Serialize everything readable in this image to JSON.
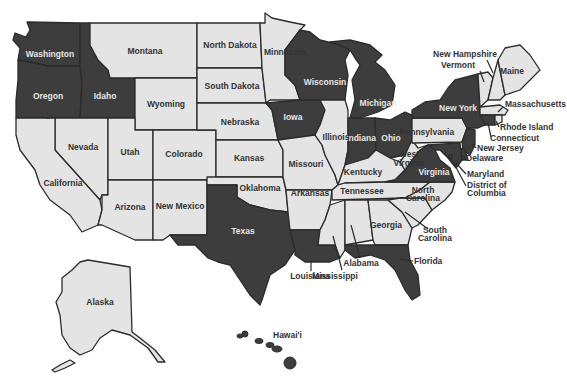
{
  "map": {
    "title": "",
    "colors": {
      "highlighted": "#3d3d3d",
      "normal": "#e4e4e4",
      "border": "#2b2b2b",
      "label_on_dark": "#e6e6e6",
      "label_on_light": "#333333",
      "background": "#ffffff"
    },
    "states": {
      "washington": {
        "label": "Washington",
        "highlighted": true
      },
      "oregon": {
        "label": "Oregon",
        "highlighted": true
      },
      "idaho": {
        "label": "Idaho",
        "highlighted": true
      },
      "montana": {
        "label": "Montana",
        "highlighted": false
      },
      "wyoming": {
        "label": "Wyoming",
        "highlighted": false
      },
      "california": {
        "label": "California",
        "highlighted": false
      },
      "nevada": {
        "label": "Nevada",
        "highlighted": false
      },
      "utah": {
        "label": "Utah",
        "highlighted": false
      },
      "colorado": {
        "label": "Colorado",
        "highlighted": false
      },
      "arizona": {
        "label": "Arizona",
        "highlighted": false
      },
      "new_mexico": {
        "label": "New Mexico",
        "highlighted": false
      },
      "north_dakota": {
        "label": "North Dakota",
        "highlighted": false
      },
      "south_dakota": {
        "label": "South Dakota",
        "highlighted": false
      },
      "nebraska": {
        "label": "Nebraska",
        "highlighted": false
      },
      "kansas": {
        "label": "Kansas",
        "highlighted": false
      },
      "oklahoma": {
        "label": "Oklahoma",
        "highlighted": false
      },
      "texas": {
        "label": "Texas",
        "highlighted": true
      },
      "minnesota": {
        "label": "Minnesota",
        "highlighted": false
      },
      "iowa": {
        "label": "Iowa",
        "highlighted": true
      },
      "missouri": {
        "label": "Missouri",
        "highlighted": false
      },
      "arkansas": {
        "label": "Arkansas",
        "highlighted": false
      },
      "louisiana": {
        "label": "Louisiana",
        "highlighted": true
      },
      "wisconsin": {
        "label": "Wisconsin",
        "highlighted": true
      },
      "illinois": {
        "label": "Illinois",
        "highlighted": false
      },
      "michigan": {
        "label": "Michigan",
        "highlighted": true
      },
      "indiana": {
        "label": "Indiana",
        "highlighted": true
      },
      "ohio": {
        "label": "Ohio",
        "highlighted": true
      },
      "kentucky": {
        "label": "Kentucky",
        "highlighted": false
      },
      "tennessee": {
        "label": "Tennessee",
        "highlighted": false
      },
      "mississippi": {
        "label": "Mississippi",
        "highlighted": false
      },
      "alabama": {
        "label": "Alabama",
        "highlighted": false
      },
      "georgia": {
        "label": "Georgia",
        "highlighted": false
      },
      "florida": {
        "label": "Florida",
        "highlighted": true
      },
      "south_carolina": {
        "label": "South Carolina",
        "label_lines": [
          "South",
          "Carolina"
        ],
        "highlighted": false
      },
      "north_carolina": {
        "label": "North Carolina",
        "label_lines": [
          "North",
          "Carolina"
        ],
        "highlighted": false
      },
      "virginia": {
        "label": "Virginia",
        "highlighted": true
      },
      "west_virginia": {
        "label": "West Virginia",
        "label_lines": [
          "West",
          "Virginia"
        ],
        "highlighted": false
      },
      "pennsylvania": {
        "label": "Pennsylvania",
        "highlighted": false
      },
      "new_york": {
        "label": "New York",
        "highlighted": true
      },
      "vermont": {
        "label": "Vermont",
        "highlighted": false
      },
      "new_hampshire": {
        "label": "New Hampshire",
        "highlighted": false
      },
      "maine": {
        "label": "Maine",
        "highlighted": false
      },
      "massachusetts": {
        "label": "Massachusetts",
        "highlighted": false
      },
      "rhode_island": {
        "label": "Rhode Island",
        "highlighted": false
      },
      "connecticut": {
        "label": "Connecticut",
        "highlighted": true
      },
      "new_jersey": {
        "label": "New Jersey",
        "highlighted": true
      },
      "delaware": {
        "label": "Delaware",
        "highlighted": true
      },
      "maryland": {
        "label": "Maryland",
        "highlighted": true
      },
      "dc": {
        "label": "District of Columbia",
        "label_lines": [
          "District of",
          "Columbia"
        ],
        "highlighted": true
      },
      "alaska": {
        "label": "Alaska",
        "highlighted": false
      },
      "hawaii": {
        "label": "Hawai'i",
        "highlighted": true
      }
    }
  }
}
